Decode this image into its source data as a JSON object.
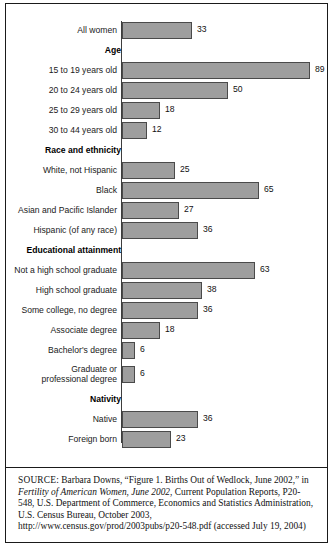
{
  "chart_data": {
    "type": "bar",
    "orientation": "horizontal",
    "title": "",
    "xlabel": "",
    "ylabel": "",
    "xlim": [
      0,
      100
    ],
    "grid": false,
    "legend": false,
    "value_suffix": "",
    "categories": [
      "All women",
      "15 to 19 years old",
      "20 to 24 years old",
      "25 to 29 years old",
      "30 to 44 years old",
      "White, not Hispanic",
      "Black",
      "Asian and Pacific Islander",
      "Hispanic (of any race)",
      "Not a high school graduate",
      "High school graduate",
      "Some college, no degree",
      "Associate degree",
      "Bachelor's degree",
      "Graduate or\nprofessional degree",
      "Native",
      "Foreign born"
    ],
    "values": [
      33,
      89,
      50,
      18,
      12,
      25,
      65,
      27,
      36,
      63,
      38,
      36,
      18,
      6,
      6,
      36,
      23
    ],
    "group_headings": [
      "Age",
      "Race and ethnicity",
      "Educational attainment",
      "Nativity"
    ],
    "rows": [
      {
        "kind": "bar",
        "label": "All women",
        "value": 33
      },
      {
        "kind": "group",
        "label": "Age"
      },
      {
        "kind": "bar",
        "label": "15 to 19 years old",
        "value": 89
      },
      {
        "kind": "bar",
        "label": "20 to 24 years old",
        "value": 50
      },
      {
        "kind": "bar",
        "label": "25 to 29 years old",
        "value": 18
      },
      {
        "kind": "bar",
        "label": "30 to 44 years old",
        "value": 12
      },
      {
        "kind": "group",
        "label": "Race and ethnicity"
      },
      {
        "kind": "bar",
        "label": "White, not Hispanic",
        "value": 25
      },
      {
        "kind": "bar",
        "label": "Black",
        "value": 65
      },
      {
        "kind": "bar",
        "label": "Asian and Pacific Islander",
        "value": 27
      },
      {
        "kind": "bar",
        "label": "Hispanic (of any race)",
        "value": 36
      },
      {
        "kind": "group",
        "label": "Educational attainment"
      },
      {
        "kind": "bar",
        "label": "Not a high school graduate",
        "value": 63
      },
      {
        "kind": "bar",
        "label": "High school graduate",
        "value": 38
      },
      {
        "kind": "bar",
        "label": "Some college, no degree",
        "value": 36
      },
      {
        "kind": "bar",
        "label": "Associate degree",
        "value": 18
      },
      {
        "kind": "bar",
        "label": "Bachelor's degree",
        "value": 6
      },
      {
        "kind": "bar",
        "label": "Graduate or\nprofessional degree",
        "value": 6,
        "tall": true
      },
      {
        "kind": "group",
        "label": "Nativity"
      },
      {
        "kind": "bar",
        "label": "Native",
        "value": 36
      },
      {
        "kind": "bar",
        "label": "Foreign born",
        "value": 23
      }
    ],
    "colors": {
      "bar_fill": "#9e9e9e",
      "bar_stroke": "#4a4a4a",
      "axis": "#3d3d3d",
      "text": "#1a1a1a",
      "frame": "#1a1a1a",
      "background": "#ffffff"
    }
  },
  "source": {
    "label": "SOURCE:",
    "segments": [
      {
        "text": " Barbara Downs, “Figure 1. Births Out of Wedlock, June 2002,” in ",
        "style": "roman"
      },
      {
        "text": "Fertility of American Women, June 2002",
        "style": "italic"
      },
      {
        "text": ", Current Population Reports, P20-548, U.S. Department of Commerce, Economics and Statistics Administration, U.S. Census Bureau, October 2003, http://www.census.gov/prod/2003pubs/p20-548.pdf (accessed July 19, 2004)",
        "style": "roman"
      }
    ],
    "full_text": "SOURCE: Barbara Downs, “Figure 1. Births Out of Wedlock, June 2002,” in Fertility of American Women, June 2002, Current Population Reports, P20-548, U.S. Department of Commerce, Economics and Statistics Administration, U.S. Census Bureau, October 2003, http://www.census.gov/prod/2003pubs/p20-548.pdf (accessed July 19, 2004)"
  }
}
